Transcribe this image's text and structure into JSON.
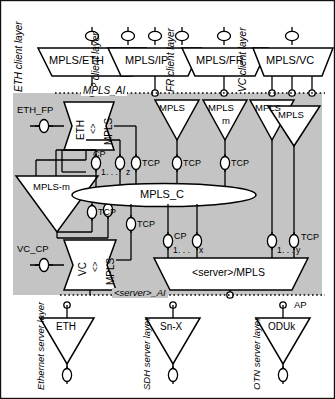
{
  "diagram": {
    "region_label_mpls_ai": "MPLS_AI",
    "region_label_server_ai": "<server>_AI",
    "connection_label": "MPLS_C",
    "colors": {
      "mpls_layer_fill": "#c4c4c4",
      "shape_fill": "#ffffff",
      "stroke": "#000000"
    }
  },
  "client_layers": [
    {
      "layer_label": "ETH client layer",
      "adaptation": "MPLS/ETH",
      "ap_count": 1
    },
    {
      "layer_label": "IP client layer",
      "adaptation": "MPLS/IP",
      "ap_count": 3
    },
    {
      "layer_label": "FR client layer",
      "adaptation": "MPLS/FR",
      "ap_count": 1
    },
    {
      "layer_label": "VC client layer",
      "adaptation": "MPLS/VC",
      "ap_count": 1
    }
  ],
  "adaptation_boxes": [
    {
      "left": "ETH",
      "mid": "<>",
      "right": "MPLS",
      "fp_label": "ETH_FP"
    },
    {
      "left": "VC",
      "mid": "<>",
      "right": "MPLS",
      "fp_label": "VC_CP"
    }
  ],
  "trail_terminations": [
    {
      "label": "MPLS"
    },
    {
      "label": "MPLS"
    },
    {
      "label": "MPLS",
      "sub": "m"
    },
    {
      "label": "MPLS"
    },
    {
      "label": "MPLS"
    }
  ],
  "matrix": {
    "label": "MPLS-m"
  },
  "server_adaptation": {
    "label": "<server>/MPLS"
  },
  "tcp_labels": [
    "TCP",
    "TCP",
    "TCP",
    "TCP",
    "TCP",
    "TCP",
    "TCP"
  ],
  "cp_groups": [
    {
      "label": "CP",
      "from": "1",
      "ellipsis": ". . .",
      "to": "z"
    },
    {
      "label": "CP",
      "from": "1",
      "ellipsis": ". . .",
      "to": "x"
    },
    {
      "label": "TCP",
      "from": "1",
      "ellipsis": ". . .",
      "to": "y"
    }
  ],
  "server_layers": [
    {
      "layer_label": "Ethernet server layer",
      "tt": "ETH"
    },
    {
      "layer_label": "SDH  server layer",
      "tt": "Sn-X"
    },
    {
      "layer_label": "OTN  server layer",
      "tt": "ODUk",
      "ap_label": "AP"
    }
  ]
}
